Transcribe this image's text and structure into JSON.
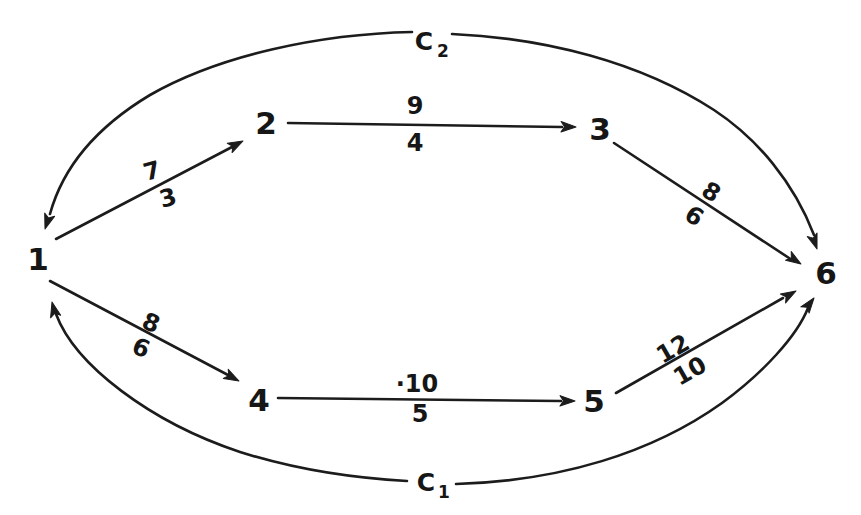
{
  "figure": {
    "background_color": "#ffffff",
    "ink_color": "#1c1c1c",
    "nodes": [
      {
        "id": "1",
        "label": "1"
      },
      {
        "id": "2",
        "label": "2"
      },
      {
        "id": "3",
        "label": "3"
      },
      {
        "id": "4",
        "label": "4"
      },
      {
        "id": "5",
        "label": "5"
      },
      {
        "id": "6",
        "label": "6"
      }
    ],
    "edges": [
      {
        "from": "1",
        "to": "2",
        "label_above": "7",
        "label_below": "3"
      },
      {
        "from": "2",
        "to": "3",
        "label_above": "9",
        "label_below": "4"
      },
      {
        "from": "3",
        "to": "6",
        "label_above": "8",
        "label_below": "6"
      },
      {
        "from": "1",
        "to": "4",
        "label_above": "8",
        "label_below": "6"
      },
      {
        "from": "4",
        "to": "5",
        "label_above": "·10",
        "label_below": "5"
      },
      {
        "from": "5",
        "to": "6",
        "label_above": "12",
        "label_below": "10"
      }
    ],
    "cycles": [
      {
        "base": "C",
        "subscript": "1",
        "position": "bottom"
      },
      {
        "base": "C",
        "subscript": "2",
        "position": "top"
      }
    ]
  }
}
